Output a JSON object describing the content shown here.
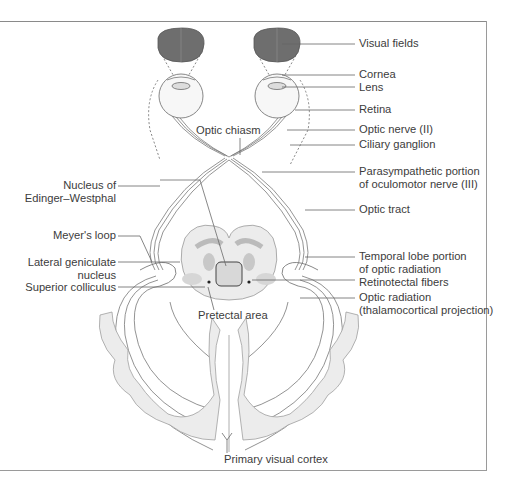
{
  "figure": {
    "colors": {
      "visual_field_fill": "#6e6e6e",
      "line": "#6a6a6a",
      "brain_tissue": "#e9e9e9",
      "nucleus_shade": "#c8c8c8",
      "frame": "#8a8a8a"
    },
    "labels_right": [
      {
        "id": "visual-fields",
        "text": "Visual fields"
      },
      {
        "id": "cornea",
        "text": "Cornea"
      },
      {
        "id": "lens",
        "text": "Lens"
      },
      {
        "id": "retina",
        "text": "Retina"
      },
      {
        "id": "optic-nerve",
        "text": "Optic nerve (II)"
      },
      {
        "id": "ciliary-ganglion",
        "text": "Ciliary ganglion"
      },
      {
        "id": "parasympathetic-1",
        "text": "Parasympathetic portion"
      },
      {
        "id": "parasympathetic-2",
        "text": "of oculomotor nerve (III)"
      },
      {
        "id": "optic-tract",
        "text": "Optic tract"
      },
      {
        "id": "temporal-lobe-1",
        "text": "Temporal lobe portion"
      },
      {
        "id": "temporal-lobe-2",
        "text": "of optic radiation"
      },
      {
        "id": "retinotectal",
        "text": "Retinotectal fibers"
      },
      {
        "id": "optic-radiation-1",
        "text": "Optic radiation"
      },
      {
        "id": "optic-radiation-2",
        "text": "(thalamocortical projection)"
      }
    ],
    "labels_left": [
      {
        "id": "edinger-1",
        "text": "Nucleus of"
      },
      {
        "id": "edinger-2",
        "text": "Edinger–Westphal"
      },
      {
        "id": "meyers-loop",
        "text": "Meyer's loop"
      },
      {
        "id": "lgn-1",
        "text": "Lateral geniculate"
      },
      {
        "id": "lgn-2",
        "text": "nucleus"
      },
      {
        "id": "superior-colliculus",
        "text": "Superior colliculus"
      }
    ],
    "labels_center": [
      {
        "id": "optic-chiasm",
        "text": "Optic chiasm"
      },
      {
        "id": "pretectal-area",
        "text": "Pretectal area"
      },
      {
        "id": "primary-visual-cortex",
        "text": "Primary visual cortex"
      }
    ]
  }
}
